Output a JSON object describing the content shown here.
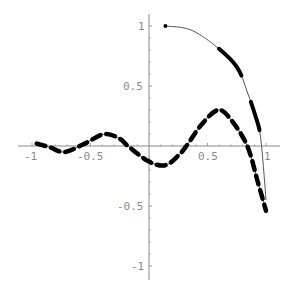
{
  "chart_data": {
    "type": "line",
    "title": "",
    "xlabel": "",
    "ylabel": "",
    "xlim": [
      -1.1,
      1.1
    ],
    "ylim": [
      -1.1,
      1.1
    ],
    "grid": false,
    "legend": null,
    "x_ticks": [
      -1,
      -0.5,
      0.5,
      1
    ],
    "y_ticks": [
      -1,
      -0.5,
      0.5,
      1
    ],
    "x_tick_labels": [
      "-1",
      "-0.5",
      "0.5",
      "1"
    ],
    "y_tick_labels": [
      "-1",
      "-0.5",
      "0.5",
      "1"
    ],
    "series": [
      {
        "name": "upper-curve",
        "style": "variable-thickness",
        "x": [
          0.14,
          0.35,
          0.56,
          0.75,
          0.84,
          0.91,
          0.95,
          0.98,
          1.0
        ],
        "y": [
          1.0,
          0.97,
          0.84,
          0.66,
          0.45,
          0.25,
          0.1,
          -0.2,
          -0.45
        ]
      },
      {
        "name": "oscillating-curve",
        "style": "dashed-variable-thickness",
        "x": [
          -0.96,
          -0.85,
          -0.72,
          -0.55,
          -0.38,
          -0.25,
          -0.18,
          0.0,
          0.14,
          0.25,
          0.32,
          0.45,
          0.59,
          0.7,
          0.84,
          0.93,
          1.0
        ],
        "y": [
          0.02,
          -0.01,
          -0.05,
          0.02,
          0.1,
          0.06,
          0.0,
          -0.13,
          -0.16,
          -0.08,
          0.0,
          0.18,
          0.3,
          0.22,
          0.0,
          -0.3,
          -0.54
        ]
      }
    ]
  },
  "axes": {
    "x_labels": [
      "-1",
      "-0.5",
      "0.5",
      "1"
    ],
    "y_labels": [
      "1",
      "0.5",
      "-0.5",
      "-1"
    ]
  }
}
